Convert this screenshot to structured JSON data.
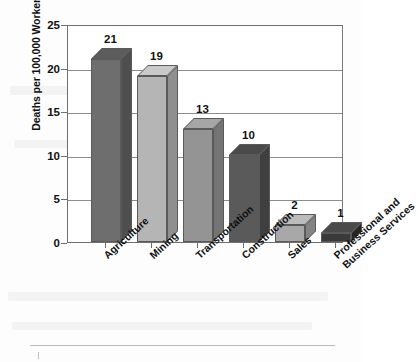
{
  "chart_data": {
    "type": "bar",
    "title": "",
    "xlabel": "",
    "ylabel": "Deaths per 100,000 Workers",
    "ylim": [
      0,
      25
    ],
    "yticks": [
      0,
      5,
      10,
      15,
      20,
      25
    ],
    "grid": true,
    "legend": "none",
    "style": "3d-bar",
    "categories": [
      "Agriculture",
      "Mining",
      "Transportation",
      "Construction",
      "Sales",
      "Professional and\nBusiness Services"
    ],
    "values": [
      21,
      19,
      13,
      10,
      2,
      1
    ],
    "value_labels": [
      "21",
      "19",
      "13",
      "10",
      "2",
      "1"
    ],
    "bar_colors": [
      "#6e6e6e",
      "#b5b5b5",
      "#949494",
      "#5a5a5a",
      "#a8a8a8",
      "#3a3a3a"
    ],
    "bar_side_colors": [
      "#4f4f4f",
      "#8f8f8f",
      "#747474",
      "#3f3f3f",
      "#848484",
      "#262626"
    ],
    "bar_top_colors": [
      "#5c5c5c",
      "#c9c9c9",
      "#a6a6a6",
      "#4a4a4a",
      "#bcbcbc",
      "#4a4a4a"
    ]
  },
  "axis": {
    "y_title": "Deaths per 100,000 Workers",
    "tick_labels": [
      "25",
      "20",
      "15",
      "10",
      "5",
      "0"
    ]
  },
  "colors": {
    "frame": "#6e6e6e",
    "gridline": "#8c8c8c",
    "text": "#111111",
    "background": "#fdfdfd"
  }
}
